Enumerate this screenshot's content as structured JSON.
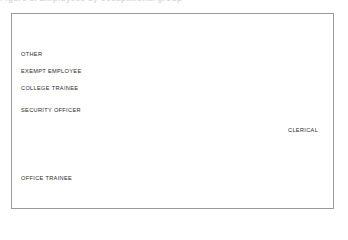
{
  "page": {
    "clipped_heading": "Figure 3.  Employees by occupational group",
    "background": "#ffffff",
    "frame_color": "#9a9a9e"
  },
  "chart_data": {
    "type": "pie",
    "title": "",
    "subtitle": "",
    "xlabel": "",
    "ylabel": "",
    "legend_position": "callout-labels",
    "grid": false,
    "exploded": true,
    "start_angle_deg": -80,
    "direction": "clockwise",
    "center": {
      "x": 180,
      "y": 130
    },
    "radius": 68,
    "categories": [
      "CLERICAL",
      "OFFICE TRAINEE",
      "SECURITY OFFICER",
      "COLLEGE TRAINEE",
      "EXEMPT EMPLOYEE",
      "OTHER"
    ],
    "values": [
      48.5,
      27.0,
      8.5,
      9.0,
      5.0,
      2.0
    ],
    "units": "percent",
    "slices": [
      {
        "label": "CLERICAL",
        "value": 48.5,
        "color": "#333335",
        "start_deg": -80,
        "end_deg": 94.6,
        "explode": 5,
        "label_side": "right",
        "label_x": 288,
        "label_y": 127,
        "leader_x1": 249,
        "leader_x2": 286,
        "leader_y": 130,
        "rule_x1": 286,
        "rule_x2": 327,
        "rule_y": 133
      },
      {
        "label": "OFFICE TRAINEE",
        "value": 27.0,
        "color": "#121214",
        "start_deg": 94.6,
        "end_deg": 191.8,
        "explode": 5,
        "label_side": "left",
        "label_x": 21,
        "label_y": 175,
        "leader_x1": 21,
        "leader_x2": 143,
        "leader_y": 179,
        "rule_x1": 21,
        "rule_x2": 143,
        "rule_y": 179
      },
      {
        "label": "SECURITY OFFICER",
        "value": 8.5,
        "color": "#4c4c4e",
        "start_deg": 191.8,
        "end_deg": 222.4,
        "explode": 5,
        "label_side": "left",
        "label_x": 21,
        "label_y": 107,
        "leader_x1": 21,
        "leader_x2": 124,
        "leader_y": 111,
        "rule_x1": 21,
        "rule_x2": 124,
        "rule_y": 111
      },
      {
        "label": "COLLEGE TRAINEE",
        "value": 9.0,
        "color": "#8b8b8d",
        "start_deg": 222.4,
        "end_deg": 254.8,
        "explode": 5,
        "label_side": "left",
        "label_x": 21,
        "label_y": 85,
        "leader_x1": 21,
        "leader_x2": 141,
        "leader_y": 89,
        "rule_x1": 21,
        "rule_x2": 141,
        "rule_y": 89
      },
      {
        "label": "EXEMPT EMPLOYEE",
        "value": 5.0,
        "color": "#7b7b7d",
        "start_deg": 254.8,
        "end_deg": 272.8,
        "explode": 5,
        "label_side": "left",
        "label_x": 21,
        "label_y": 68,
        "leader_x1": 21,
        "leader_x2": 168,
        "leader_y": 72,
        "rule_x1": 21,
        "rule_x2": 168,
        "rule_y": 72
      },
      {
        "label": "OTHER",
        "value": 2.0,
        "color": "#56565a",
        "start_deg": 272.8,
        "end_deg": 280,
        "explode": 5,
        "label_side": "left",
        "label_x": 21,
        "label_y": 51,
        "leader_x1": 21,
        "leader_x2": 177,
        "leader_y": 55,
        "rule_x1": 21,
        "rule_x2": 177,
        "rule_y": 55
      }
    ],
    "leader_color": "#6d6d70",
    "slice_gap_color": "#ffffff"
  }
}
